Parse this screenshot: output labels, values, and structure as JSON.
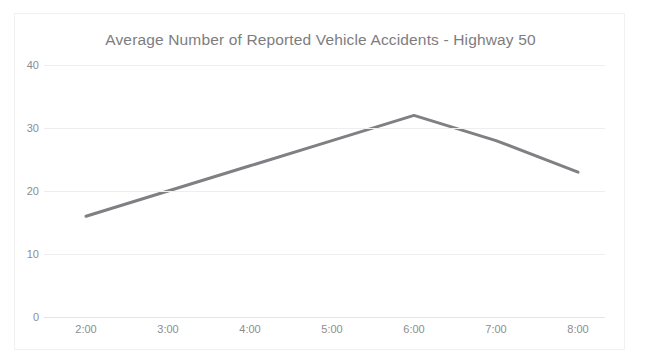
{
  "top_clip": {
    "ghost_text": "· · · · · · · · · · · ·"
  },
  "chart_data": {
    "type": "line",
    "title": "Average Number of Reported Vehicle Accidents - Highway 50",
    "xlabel": "",
    "ylabel": "",
    "categories": [
      "2:00",
      "3:00",
      "4:00",
      "5:00",
      "6:00",
      "7:00",
      "8:00"
    ],
    "values": [
      16,
      20,
      24,
      28,
      32,
      28,
      23
    ],
    "series": [
      {
        "name": "Average Number of Reported Vehicle Accidents",
        "values": [
          16,
          20,
          24,
          28,
          32,
          28,
          23
        ]
      }
    ],
    "ylim": [
      0,
      40
    ],
    "yticks": [
      0,
      10,
      20,
      30,
      40
    ],
    "ytick_labels": [
      "0",
      "10",
      "20",
      "30",
      "40"
    ],
    "xtick_labels": [
      "2:00",
      "3:00",
      "4:00",
      "5:00",
      "6:00",
      "7:00",
      "8:00"
    ],
    "grid": true,
    "grid_axis": "y",
    "legend": false,
    "legend_position": "none",
    "line_color": "#808084",
    "line_width": 3,
    "markers": false,
    "background": "#ffffff",
    "title_color": "#7d7d80",
    "tick_color": "#8d8d90",
    "gridline_color": "#eeeeef"
  }
}
